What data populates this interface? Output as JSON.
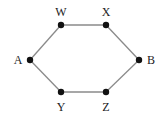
{
  "diagram": {
    "type": "graph",
    "shape": "hexagon",
    "colors": {
      "edge": "#8a8a8a",
      "node": "#111111",
      "label": "#222222",
      "background": "#ffffff"
    },
    "nodes": [
      {
        "id": "A",
        "label": "A",
        "x": 30,
        "y": 60,
        "lx": 18,
        "ly": 64
      },
      {
        "id": "W",
        "label": "W",
        "x": 61,
        "y": 25,
        "lx": 61,
        "ly": 16
      },
      {
        "id": "X",
        "label": "X",
        "x": 106,
        "y": 25,
        "lx": 106,
        "ly": 16
      },
      {
        "id": "B",
        "label": "B",
        "x": 139,
        "y": 60,
        "lx": 151,
        "ly": 64
      },
      {
        "id": "Z",
        "label": "Z",
        "x": 106,
        "y": 92,
        "lx": 106,
        "ly": 111
      },
      {
        "id": "Y",
        "label": "Y",
        "x": 61,
        "y": 92,
        "lx": 61,
        "ly": 111
      }
    ],
    "edges": [
      [
        "A",
        "W"
      ],
      [
        "W",
        "X"
      ],
      [
        "X",
        "B"
      ],
      [
        "B",
        "Z"
      ],
      [
        "Z",
        "Y"
      ],
      [
        "Y",
        "A"
      ]
    ]
  }
}
